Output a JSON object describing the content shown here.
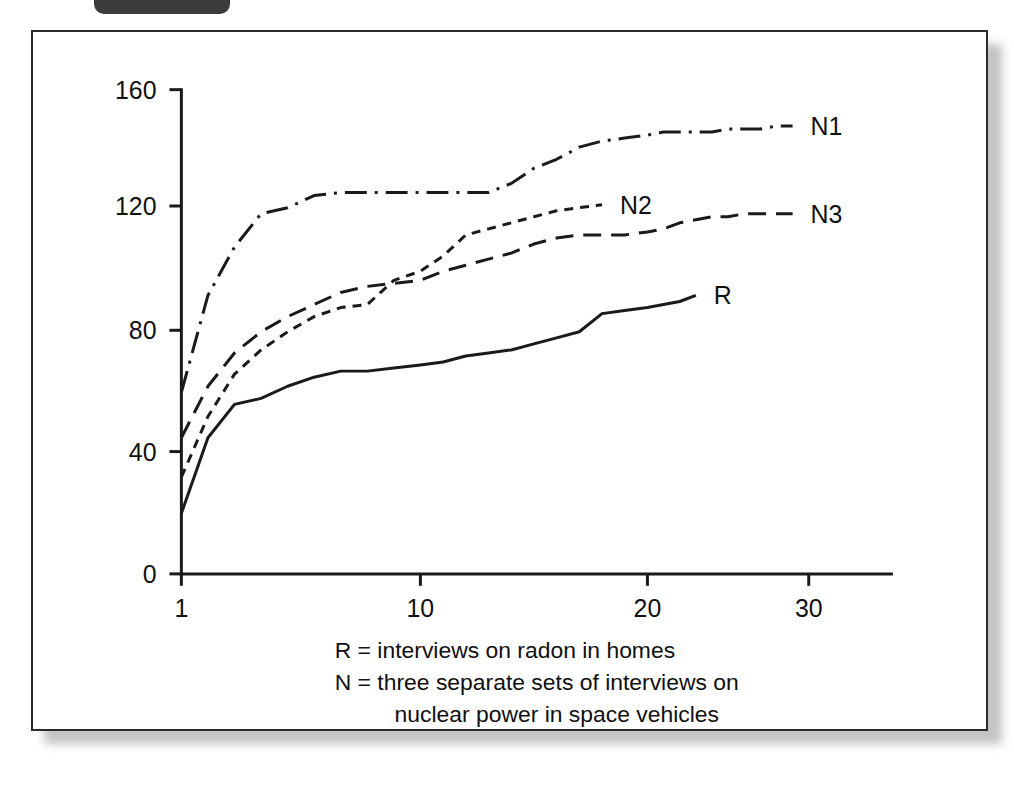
{
  "window": {
    "tab_shape": "dark-rounded-tab",
    "background_color": "#ffffff",
    "frame_border_color": "#2b2b2b"
  },
  "chart_data": {
    "type": "line",
    "title": "",
    "subtitle": "",
    "xlabel": "",
    "ylabel": "",
    "xlim": [
      1,
      35
    ],
    "ylim": [
      0,
      160
    ],
    "grid": false,
    "legend_position": "inline-right-of-line-ends",
    "x_ticks": [
      "1",
      "10",
      "20",
      "30"
    ],
    "x_tick_values": [
      1,
      10,
      20,
      30
    ],
    "y_ticks": [
      "0",
      "40",
      "80",
      "120",
      "160"
    ],
    "y_tick_values": [
      0,
      40,
      80,
      120,
      160
    ],
    "series": [
      {
        "name": "N1",
        "label": "N1",
        "style": "dash-dot",
        "color": "#1a1a1a",
        "x": [
          1,
          2,
          3,
          4,
          5,
          6,
          7,
          8,
          9,
          10,
          11,
          12,
          13,
          14,
          15,
          16,
          17,
          18,
          19,
          20,
          21,
          22,
          23,
          24,
          25,
          26,
          27,
          28,
          29
        ],
        "values": [
          60,
          92,
          108,
          119,
          121,
          125,
          126,
          126,
          126,
          126,
          126,
          126,
          126,
          129,
          134,
          137,
          141,
          143,
          144,
          145,
          146,
          146,
          146,
          146,
          147,
          147,
          147,
          148,
          148
        ]
      },
      {
        "name": "N2",
        "label": "N2",
        "style": "short-dash",
        "color": "#1a1a1a",
        "x": [
          1,
          2,
          3,
          4,
          5,
          6,
          7,
          8,
          9,
          10,
          11,
          12,
          13,
          14,
          15,
          16,
          17,
          18
        ],
        "values": [
          32,
          52,
          66,
          74,
          80,
          85,
          88,
          89,
          97,
          100,
          105,
          112,
          114,
          116,
          118,
          120,
          121,
          122
        ]
      },
      {
        "name": "N3",
        "label": "N3",
        "style": "long-dash",
        "color": "#1a1a1a",
        "x": [
          1,
          2,
          3,
          4,
          5,
          6,
          7,
          8,
          9,
          10,
          11,
          12,
          13,
          14,
          15,
          16,
          17,
          18,
          19,
          20,
          21,
          22,
          23,
          24,
          25,
          26,
          27,
          28,
          29
        ],
        "values": [
          45,
          62,
          73,
          80,
          85,
          89,
          93,
          95,
          96,
          97,
          100,
          102,
          104,
          106,
          109,
          111,
          112,
          112,
          112,
          113,
          114,
          116,
          117,
          118,
          118,
          119,
          119,
          119,
          119
        ]
      },
      {
        "name": "R",
        "label": "R",
        "style": "solid",
        "color": "#1a1a1a",
        "x": [
          1,
          2,
          3,
          4,
          5,
          6,
          7,
          8,
          9,
          10,
          11,
          12,
          13,
          14,
          15,
          16,
          17,
          18,
          19,
          20,
          21,
          22,
          23
        ],
        "values": [
          20,
          45,
          56,
          58,
          62,
          65,
          67,
          67,
          68,
          69,
          70,
          72,
          73,
          74,
          76,
          78,
          80,
          86,
          87,
          88,
          89,
          90,
          92
        ]
      }
    ],
    "annotations": [
      "R = interviews on radon in homes",
      "N = three separate sets of interviews on",
      "nuclear power in space vehicles"
    ]
  },
  "caption": {
    "line1": "R = interviews on radon in homes",
    "line2": "N = three separate sets of interviews on",
    "line3": "nuclear power in space vehicles"
  }
}
